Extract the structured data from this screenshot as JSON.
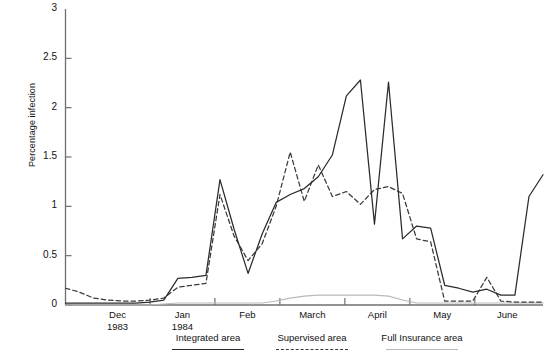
{
  "chart_data": {
    "type": "line",
    "title": "",
    "xlabel": "",
    "ylabel": "Percentage infection",
    "ylim": [
      0,
      3
    ],
    "yticks": [
      0,
      0.5,
      1,
      1.5,
      2,
      2.5,
      3
    ],
    "ytick_labels": [
      "0",
      "0.5",
      "1",
      "1.5",
      "2",
      "2.5",
      "3"
    ],
    "grid": false,
    "legend_position": "bottom",
    "xtick_labels": [
      "Dec",
      "Jan",
      "Feb",
      "March",
      "April",
      "May",
      "June"
    ],
    "xtick_sublabels": [
      "1983",
      "1984",
      "",
      "",
      "",
      "",
      ""
    ],
    "x_axis_note": "weekly observations spanning Dec 1983 through June 1984",
    "x": [
      0,
      1,
      2,
      3,
      4,
      5,
      6,
      7,
      8,
      9,
      10,
      11,
      12,
      13,
      14,
      15,
      16,
      17,
      18,
      19,
      20,
      21,
      22,
      23,
      24,
      25,
      26,
      27,
      28,
      29,
      30,
      31,
      32,
      33,
      34
    ],
    "series": [
      {
        "name": "Integrated area",
        "style": "solid",
        "color": "#2b2b2b",
        "values": [
          0.02,
          0.02,
          0.02,
          0.02,
          0.02,
          0.02,
          0.03,
          0.05,
          0.27,
          0.28,
          0.3,
          1.27,
          0.77,
          0.32,
          0.72,
          1.04,
          1.12,
          1.18,
          1.3,
          1.52,
          2.12,
          2.28,
          0.82,
          2.26,
          0.67,
          0.8,
          0.78,
          0.2,
          0.17,
          0.13,
          0.16,
          0.1,
          0.1,
          1.1,
          1.32
        ]
      },
      {
        "name": "Supervised area",
        "style": "dashed",
        "color": "#3a3a3a",
        "values": [
          0.17,
          0.13,
          0.07,
          0.05,
          0.04,
          0.04,
          0.05,
          0.07,
          0.18,
          0.2,
          0.22,
          1.12,
          0.7,
          0.45,
          0.62,
          1.0,
          1.55,
          1.05,
          1.42,
          1.1,
          1.15,
          1.02,
          1.17,
          1.2,
          1.13,
          0.67,
          0.64,
          0.04,
          0.04,
          0.04,
          0.28,
          0.04,
          0.03,
          0.03,
          0.03
        ]
      },
      {
        "name": "Full Insurance area",
        "style": "light-solid",
        "color": "#b9b9b9",
        "values": [
          0.0,
          0.0,
          0.0,
          0.0,
          0.0,
          0.0,
          0.0,
          0.01,
          0.02,
          0.02,
          0.02,
          0.02,
          0.02,
          0.02,
          0.02,
          0.04,
          0.07,
          0.09,
          0.1,
          0.1,
          0.1,
          0.1,
          0.1,
          0.09,
          0.05,
          0.02,
          0.02,
          0.02,
          0.02,
          0.02,
          0.02,
          0.02,
          0.02,
          0.02,
          0.02
        ]
      }
    ]
  },
  "legend": {
    "items": [
      {
        "label": "Integrated area",
        "style": "solid"
      },
      {
        "label": "Supervised area",
        "style": "dashed"
      },
      {
        "label": "Full Insurance area",
        "style": "light-solid"
      }
    ]
  },
  "axis": {
    "y_title": "Percentage infection"
  }
}
